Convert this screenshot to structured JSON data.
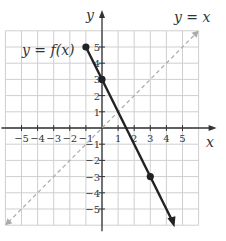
{
  "chart_data": {
    "type": "line",
    "title": "",
    "xlabel": "x",
    "ylabel": "y",
    "xlim": [
      -6,
      6
    ],
    "ylim": [
      -6,
      6
    ],
    "grid": true,
    "x_ticks": [
      -5,
      -4,
      -3,
      -2,
      -1,
      1,
      2,
      3,
      4,
      5
    ],
    "y_ticks": [
      -5,
      -4,
      -3,
      -2,
      -1,
      1,
      2,
      3,
      4,
      5
    ],
    "series": [
      {
        "name": "y = f(x)",
        "style": "solid",
        "color": "#222222",
        "points": [
          [
            -1,
            5
          ],
          [
            0,
            3
          ],
          [
            3,
            -3
          ]
        ],
        "extends_to": [
          4.5,
          -6
        ],
        "marked_points": [
          [
            -1,
            5
          ],
          [
            0,
            3
          ],
          [
            3,
            -3
          ]
        ],
        "label_position": [
          -4,
          4
        ]
      },
      {
        "name": "y = x",
        "style": "dashed",
        "color": "#aaaaaa",
        "points": [
          [
            -6,
            -6
          ],
          [
            6,
            6
          ]
        ],
        "label_position": [
          5.5,
          6.5
        ]
      }
    ],
    "annotations": [
      "y = f(x)",
      "y = x"
    ]
  },
  "labels": {
    "x_axis": "x",
    "y_axis": "y",
    "f_label": "y = f(x)",
    "identity_label": "y = x",
    "x_ticks": [
      "−5",
      "−4",
      "−3",
      "−2",
      "−1",
      "1",
      "2",
      "3",
      "4",
      "5"
    ],
    "y_ticks": [
      "5",
      "4",
      "3",
      "2",
      "1",
      "−1",
      "−2",
      "−3",
      "−4",
      "−5"
    ]
  }
}
